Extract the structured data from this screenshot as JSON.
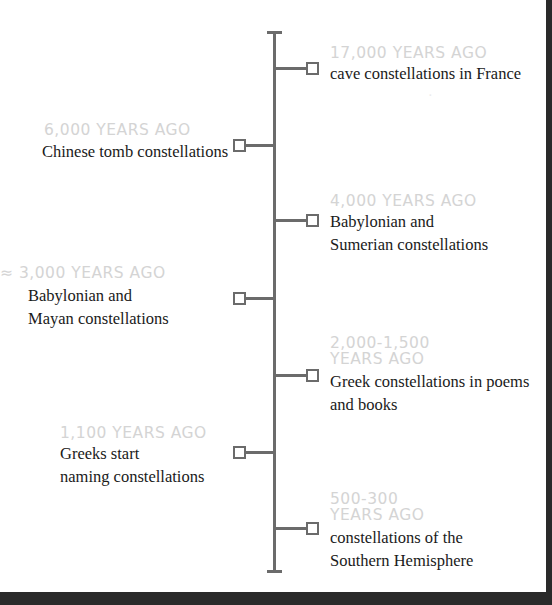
{
  "timeline": {
    "colors": {
      "line": "#6b6b6b",
      "header": "#d4d4d4",
      "text": "#1a1a1a",
      "background": "#ffffff",
      "frame": "#2a2a2a"
    },
    "events": [
      {
        "side": "right",
        "header": "17,000 YEARS AGO",
        "desc_lines": [
          "cave constellations in France"
        ]
      },
      {
        "side": "left",
        "header": "6,000 YEARS AGO",
        "desc_lines": [
          "Chinese tomb constellations"
        ]
      },
      {
        "side": "right",
        "header": "4,000 YEARS AGO",
        "desc_lines": [
          "Babylonian and",
          "Sumerian constellations"
        ]
      },
      {
        "side": "left",
        "header": "≈ 3,000 YEARS AGO",
        "desc_lines": [
          "Babylonian and",
          "Mayan constellations"
        ]
      },
      {
        "side": "right",
        "header_lines": [
          "2,000-1,500",
          "YEARS AGO"
        ],
        "desc_lines": [
          "Greek constellations in poems",
          "and books"
        ]
      },
      {
        "side": "left",
        "header": "1,100 YEARS AGO",
        "desc_lines": [
          "Greeks start",
          "naming constellations"
        ]
      },
      {
        "side": "right",
        "header_lines": [
          "500-300",
          "YEARS AGO"
        ],
        "desc_lines": [
          "constellations of the",
          "Southern Hemisphere"
        ]
      }
    ]
  }
}
